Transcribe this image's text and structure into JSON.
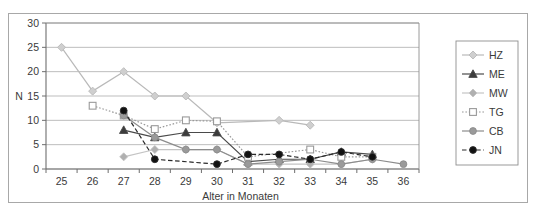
{
  "figure": {
    "background_color": "#ffffff",
    "frame_color": "#a8a8a8",
    "plot_border_color": "#808080",
    "gridline_color": "#b5b5b5"
  },
  "chart_data": {
    "type": "line",
    "title": "",
    "subtitle": "",
    "xlabel": "Alter in Monaten",
    "ylabel": "N",
    "x": [
      25,
      26,
      27,
      28,
      29,
      30,
      31,
      32,
      33,
      34,
      35,
      36
    ],
    "xlim": [
      24.5,
      36.5
    ],
    "ylim": [
      0,
      30
    ],
    "x_ticks": [
      "25",
      "26",
      "27",
      "28",
      "29",
      "30",
      "31",
      "32",
      "33",
      "34",
      "35",
      "36"
    ],
    "y_ticks": [
      "0",
      "5",
      "10",
      "15",
      "20",
      "25",
      "30"
    ],
    "y_tick_step": 5,
    "grid": "horizontal",
    "legend_position": "right",
    "series": [
      {
        "name": "HZ",
        "color": "#b9b9b9",
        "marker": "diamond",
        "marker_fill": "#cfcfcf",
        "line_style": "solid",
        "x": [
          25,
          26,
          27,
          28,
          29,
          30,
          32,
          33
        ],
        "values": [
          25,
          16,
          20,
          15,
          15,
          9.5,
          10,
          9
        ]
      },
      {
        "name": "ME",
        "color": "#4a4a4a",
        "marker": "triangle",
        "marker_fill": "#3c3c3c",
        "line_style": "solid",
        "x": [
          27,
          28,
          29,
          30,
          31,
          32,
          33,
          34,
          35
        ],
        "values": [
          8,
          6.5,
          7.5,
          7.5,
          1.5,
          2,
          2,
          3.5,
          3
        ]
      },
      {
        "name": "MW",
        "color": "#c4c4c4",
        "marker": "diamond",
        "marker_fill": "#b0b0b0",
        "line_style": "solid",
        "x": [
          27,
          28,
          29,
          30,
          31,
          32,
          33,
          34,
          35
        ],
        "values": [
          2.5,
          4,
          4,
          4,
          1,
          1,
          1,
          1,
          2
        ]
      },
      {
        "name": "TG",
        "color": "#9a9a9a",
        "marker": "square-open",
        "marker_fill": "#ffffff",
        "line_style": "dotted",
        "x": [
          26,
          27,
          28,
          29,
          30,
          31,
          33,
          34,
          35
        ],
        "values": [
          13,
          11,
          8.2,
          10,
          9.8,
          2.5,
          4,
          2.5,
          2.5
        ]
      },
      {
        "name": "CB",
        "color": "#8c8c8c",
        "marker": "circle",
        "marker_fill": "#9a9a9a",
        "line_style": "solid",
        "x": [
          27,
          28,
          29,
          30,
          31,
          32,
          33,
          34,
          35,
          36
        ],
        "values": [
          11,
          6.5,
          4,
          4,
          1,
          1.5,
          2,
          1,
          2,
          1
        ]
      },
      {
        "name": "JN",
        "color": "#2a2a2a",
        "marker": "circle",
        "marker_fill": "#111111",
        "line_style": "dashed",
        "x": [
          27,
          28,
          30,
          31,
          32,
          33,
          34,
          35
        ],
        "values": [
          12,
          2,
          1,
          3,
          3,
          2,
          3.5,
          2.5
        ]
      }
    ]
  },
  "legend": {
    "entries": [
      {
        "label": "HZ"
      },
      {
        "label": "ME"
      },
      {
        "label": "MW"
      },
      {
        "label": "TG"
      },
      {
        "label": "CB"
      },
      {
        "label": "JN"
      }
    ]
  }
}
